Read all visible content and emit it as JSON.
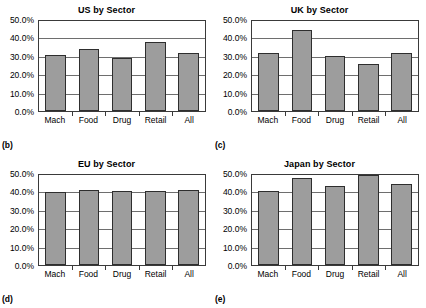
{
  "figure": {
    "panels": [
      {
        "id": "us",
        "label": "(b)",
        "title": "US by Sector"
      },
      {
        "id": "uk",
        "label": "(c)",
        "title": "UK by Sector"
      },
      {
        "id": "eu",
        "label": "(d)",
        "title": "EU by Sector"
      },
      {
        "id": "japan",
        "label": "(e)",
        "title": "Japan by Sector"
      }
    ],
    "colors": {
      "bar_fill": "#9d9d9d",
      "bar_border": "#2e2e2e",
      "gridline": "#6e6e6e",
      "axis": "#3a3a3a",
      "text": "#000000",
      "background": "#ffffff"
    }
  },
  "chart_data": [
    {
      "type": "bar",
      "title": "US by Sector",
      "panel_label": "(b)",
      "xlabel": "",
      "ylabel": "",
      "categories": [
        "Mach",
        "Food",
        "Drug",
        "Retail",
        "All"
      ],
      "values": [
        30.7,
        33.5,
        29.0,
        37.5,
        31.5
      ],
      "value_labels": [
        "30.7%",
        "33.5%",
        "29.0%",
        "37.5%",
        "31.5%"
      ],
      "ylim": [
        0,
        50
      ],
      "yticks": [
        0,
        10,
        20,
        30,
        40,
        50
      ],
      "ytick_labels": [
        "0.0%",
        "10.0%",
        "20.0%",
        "30.0%",
        "40.0%",
        "50.0%"
      ],
      "grid": true,
      "legend": false
    },
    {
      "type": "bar",
      "title": "UK by Sector",
      "panel_label": "(c)",
      "xlabel": "",
      "ylabel": "",
      "categories": [
        "Mach",
        "Food",
        "Drug",
        "Retail",
        "All"
      ],
      "values": [
        31.3,
        43.8,
        30.0,
        25.3,
        31.8
      ],
      "value_labels": [
        "31.3%",
        "43.8%",
        "30.0%",
        "25.3%",
        "31.8%"
      ],
      "ylim": [
        0,
        50
      ],
      "yticks": [
        0,
        10,
        20,
        30,
        40,
        50
      ],
      "ytick_labels": [
        "0.0%",
        "10.0%",
        "20.0%",
        "30.0%",
        "40.0%",
        "50.0%"
      ],
      "grid": true,
      "legend": false
    },
    {
      "type": "bar",
      "title": "EU by Sector",
      "panel_label": "(d)",
      "xlabel": "",
      "ylabel": "",
      "categories": [
        "Mach",
        "Food",
        "Drug",
        "Retail",
        "All"
      ],
      "values": [
        39.9,
        40.7,
        40.3,
        40.1,
        41.0
      ],
      "value_labels": [
        "39.9%",
        "40.7%",
        "40.3%",
        "40.1%",
        "41.0%"
      ],
      "ylim": [
        0,
        50
      ],
      "yticks": [
        0,
        10,
        20,
        30,
        40,
        50
      ],
      "ytick_labels": [
        "0.0%",
        "10.0%",
        "20.0%",
        "30.0%",
        "40.0%",
        "50.0%"
      ],
      "grid": true,
      "legend": false
    },
    {
      "type": "bar",
      "title": "Japan by Sector",
      "panel_label": "(e)",
      "xlabel": "",
      "ylabel": "",
      "categories": [
        "Mach",
        "Food",
        "Drug",
        "Retail",
        "All"
      ],
      "values": [
        40.3,
        47.3,
        42.8,
        48.7,
        44.2
      ],
      "value_labels": [
        "40.3%",
        "47.3%",
        "42.8%",
        "48.7%",
        "44.2%"
      ],
      "ylim": [
        0,
        50
      ],
      "yticks": [
        0,
        10,
        20,
        30,
        40,
        50
      ],
      "ytick_labels": [
        "0.0%",
        "10.0%",
        "20.0%",
        "30.0%",
        "40.0%",
        "50.0%"
      ],
      "grid": true,
      "legend": false
    }
  ]
}
